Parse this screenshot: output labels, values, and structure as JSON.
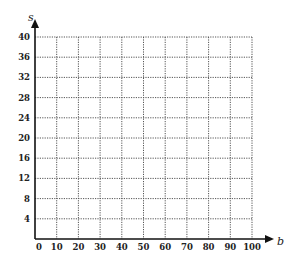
{
  "chart_data": {
    "type": "line",
    "title": "",
    "xlabel": "b",
    "ylabel": "s",
    "x_ticks": [
      0,
      10,
      20,
      30,
      40,
      50,
      60,
      70,
      80,
      90,
      100
    ],
    "y_ticks": [
      4,
      8,
      12,
      16,
      20,
      24,
      28,
      32,
      36,
      40
    ],
    "xlim": [
      0,
      100
    ],
    "ylim": [
      0,
      40
    ],
    "grid": true,
    "grid_style": "dotted",
    "series": [],
    "legend": null
  },
  "colors": {
    "axis": "#111111",
    "grid": "#555555",
    "text": "#222222",
    "background": "#ffffff"
  }
}
